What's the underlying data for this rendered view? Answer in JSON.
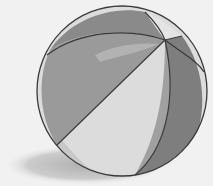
{
  "image": {
    "subject": "beach ball",
    "style": "grayscale illustration",
    "colors": {
      "background": "#f1f1f1",
      "shadow": "#c4c4c4",
      "panel_dark": "#8a8a8a",
      "panel_mid": "#a8a8a8",
      "panel_light": "#dcdcdc",
      "panel_lightest": "#e8e8e8",
      "outline": "#3a3a3a"
    }
  }
}
